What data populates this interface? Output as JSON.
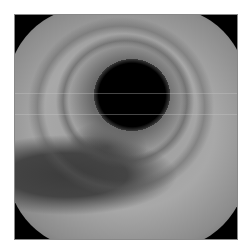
{
  "image": {
    "description": "Grayscale endoscopic (bronchoscopic) view of an airway lumen",
    "lumen": {
      "center_x": 135,
      "center_y": 100,
      "radius": 34,
      "color": "#000000"
    },
    "dark_region": {
      "position": "lower-left",
      "color": "#3c3c3c"
    },
    "wall_color": "#a0a0a0",
    "corner_mask_color": "#000000"
  }
}
